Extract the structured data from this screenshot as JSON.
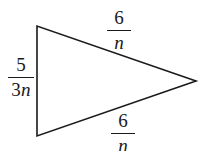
{
  "figure": {
    "type": "geometry-diagram",
    "shape": "triangle",
    "background_color": "#ffffff",
    "stroke_color": "#1a1a1a",
    "stroke_width": 1.6,
    "width": 203,
    "height": 151,
    "vertices": [
      {
        "name": "top-left",
        "x": 37,
        "y": 26
      },
      {
        "name": "bottom-left",
        "x": 37,
        "y": 136
      },
      {
        "name": "right",
        "x": 196,
        "y": 81
      }
    ],
    "labels": {
      "left_side": {
        "text": "5/3n",
        "numerator": "5",
        "denominator_coefficient": "3",
        "denominator_variable": "n"
      },
      "top_side": {
        "text": "6/n",
        "numerator": "6",
        "denominator_coefficient": "",
        "denominator_variable": "n"
      },
      "bottom_side": {
        "text": "6/n",
        "numerator": "6",
        "denominator_coefficient": "",
        "denominator_variable": "n"
      }
    }
  }
}
